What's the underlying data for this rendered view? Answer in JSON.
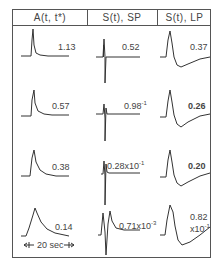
{
  "headers": [
    "A(t, t*)",
    "S(t), SP",
    "S(t), LP"
  ],
  "rows": [
    {
      "a": "1.13",
      "sp": "0.52",
      "sp_exp": "",
      "lp": "0.37",
      "lp_exp": ""
    },
    {
      "a": "0.57",
      "sp": "0.98",
      "sp_exp": "-1",
      "lp": "0.26",
      "lp_exp": ""
    },
    {
      "a": "0.38",
      "sp": "0.28x10",
      "sp_exp": "-1",
      "lp": "0.20",
      "lp_exp": ""
    },
    {
      "a": "0.14",
      "sp": "0.71x10",
      "sp_exp": "-3",
      "lp": "0.82",
      "lp_exp": "x10",
      "lp_exp2": "-1"
    }
  ],
  "scale_bar": {
    "label": "20 sec"
  },
  "colors": {
    "line": "#333333",
    "border": "#555555"
  }
}
